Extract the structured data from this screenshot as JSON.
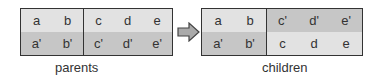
{
  "parents": {
    "label": "parents",
    "rows": [
      {
        "left": [
          "a",
          "b"
        ],
        "right": [
          "c",
          "d",
          "e"
        ]
      },
      {
        "left": [
          "a'",
          "b'"
        ],
        "right": [
          "c'",
          "d'",
          "e'"
        ]
      }
    ]
  },
  "children": {
    "label": "children",
    "rows": [
      {
        "left": [
          "a",
          "b"
        ],
        "right": [
          "c'",
          "d'",
          "e'"
        ]
      },
      {
        "left": [
          "a'",
          "b'"
        ],
        "right": [
          "c",
          "d",
          "e"
        ]
      }
    ]
  },
  "colors": {
    "light": "#e2e2e2",
    "dark": "#c6c6c6",
    "border": "#333333"
  }
}
